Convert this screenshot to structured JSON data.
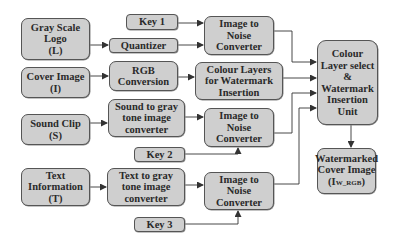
{
  "diagram": {
    "nodes": {
      "logo": {
        "label": "Gray Scale\nLogo\n(L)"
      },
      "key1": {
        "label": "Key 1"
      },
      "quantizer": {
        "label": "Quantizer"
      },
      "inc1": {
        "label": "Image to\nNoise\nConverter"
      },
      "cover": {
        "label": "Cover Image\n(I)"
      },
      "rgb": {
        "label": "RGB\nConversion"
      },
      "layers": {
        "label": "Colour Layers\nfor Watermark\nInsertion"
      },
      "unit": {
        "label": "Colour\nLayer select\n&\nWatermark\nInsertion\nUnit"
      },
      "sound": {
        "label": "Sound Clip\n(S)"
      },
      "sound2gray": {
        "label": "Sound to gray\ntone image\nconverter"
      },
      "inc2": {
        "label": "Image to\nNoise\nConverter"
      },
      "key2": {
        "label": "Key 2"
      },
      "text": {
        "label": "Text\nInformation\n(T)"
      },
      "text2gray": {
        "label": "Text to gray\ntone image\nconverter"
      },
      "inc3": {
        "label": "Image to\nNoise\nConverter"
      },
      "key3": {
        "label": "Key 3"
      },
      "output": {
        "label_main": "Watermarked\nCover Image\n(I",
        "label_sub": "W_RGB",
        "label_end": ")"
      }
    },
    "edges": [
      {
        "from": "key1",
        "to": "inc1"
      },
      {
        "from": "logo",
        "to": "quantizer"
      },
      {
        "from": "quantizer",
        "to": "inc1"
      },
      {
        "from": "cover",
        "to": "rgb"
      },
      {
        "from": "rgb",
        "to": "layers"
      },
      {
        "from": "inc1",
        "to": "unit"
      },
      {
        "from": "layers",
        "to": "unit"
      },
      {
        "from": "sound",
        "to": "sound2gray"
      },
      {
        "from": "sound2gray",
        "to": "inc2"
      },
      {
        "from": "key2",
        "to": "inc2"
      },
      {
        "from": "inc2",
        "to": "unit"
      },
      {
        "from": "text",
        "to": "text2gray"
      },
      {
        "from": "text2gray",
        "to": "inc3"
      },
      {
        "from": "key3",
        "to": "inc3"
      },
      {
        "from": "inc3",
        "to": "unit"
      },
      {
        "from": "unit",
        "to": "output"
      }
    ],
    "colors": {
      "box_fill": "#cfcfcf",
      "box_border": "#555555",
      "line": "#333333"
    }
  }
}
